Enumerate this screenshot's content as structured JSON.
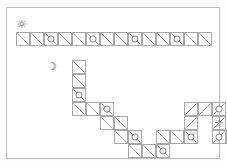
{
  "page": {
    "background_color": "#ffffff",
    "frame_color": "#b9b9b9",
    "cell_border_color": "#a8a8a8",
    "diagonal_color": "#7f7f7f",
    "circle_color": "#6f6f6f"
  },
  "grid": {
    "cell_size": 14,
    "origin_x": 9,
    "origin_y": 24,
    "columns": 15,
    "rows": 9
  },
  "markers": [
    {
      "name": "sun-icon",
      "label": "sun",
      "glyph": "☼",
      "col": 0,
      "row": 0,
      "offset_x": 0,
      "offset_y": -13
    },
    {
      "name": "moon-icon",
      "label": "moon",
      "glyph": "☽",
      "col": 3,
      "row": 2,
      "offset_x": -12,
      "offset_y": 1
    },
    {
      "name": "star-icon",
      "label": "star",
      "glyph": "☆",
      "col": 14,
      "row": 7,
      "offset_x": 1,
      "offset_y": -12
    }
  ],
  "cells": [
    {
      "col": 0,
      "row": 0,
      "diagonal": "down",
      "circle": false
    },
    {
      "col": 1,
      "row": 0,
      "diagonal": "down",
      "circle": false
    },
    {
      "col": 2,
      "row": 0,
      "diagonal": "down",
      "circle": true
    },
    {
      "col": 3,
      "row": 0,
      "diagonal": "down",
      "circle": false
    },
    {
      "col": 4,
      "row": 0,
      "diagonal": "down",
      "circle": false
    },
    {
      "col": 5,
      "row": 0,
      "diagonal": "down",
      "circle": true
    },
    {
      "col": 6,
      "row": 0,
      "diagonal": "down",
      "circle": false
    },
    {
      "col": 7,
      "row": 0,
      "diagonal": "down",
      "circle": false
    },
    {
      "col": 8,
      "row": 0,
      "diagonal": "down",
      "circle": true
    },
    {
      "col": 9,
      "row": 0,
      "diagonal": "down",
      "circle": false
    },
    {
      "col": 10,
      "row": 0,
      "diagonal": "down",
      "circle": false
    },
    {
      "col": 11,
      "row": 0,
      "diagonal": "down",
      "circle": true
    },
    {
      "col": 12,
      "row": 0,
      "diagonal": "down",
      "circle": false
    },
    {
      "col": 13,
      "row": 0,
      "diagonal": "down",
      "circle": false
    },
    {
      "col": 4,
      "row": 2,
      "diagonal": "down",
      "circle": false
    },
    {
      "col": 4,
      "row": 3,
      "diagonal": "down",
      "circle": false
    },
    {
      "col": 4,
      "row": 4,
      "diagonal": "down",
      "circle": true
    },
    {
      "col": 4,
      "row": 5,
      "diagonal": "down",
      "circle": false
    },
    {
      "col": 5,
      "row": 5,
      "diagonal": "down",
      "circle": false
    },
    {
      "col": 6,
      "row": 5,
      "diagonal": "down",
      "circle": true
    },
    {
      "col": 6,
      "row": 6,
      "diagonal": "down",
      "circle": false
    },
    {
      "col": 7,
      "row": 6,
      "diagonal": "down",
      "circle": false
    },
    {
      "col": 7,
      "row": 7,
      "diagonal": "down",
      "circle": false
    },
    {
      "col": 8,
      "row": 7,
      "diagonal": "down",
      "circle": true
    },
    {
      "col": 8,
      "row": 8,
      "diagonal": "down",
      "circle": false
    },
    {
      "col": 9,
      "row": 8,
      "diagonal": "down",
      "circle": false
    },
    {
      "col": 10,
      "row": 8,
      "diagonal": "down",
      "circle": true
    },
    {
      "col": 10,
      "row": 7,
      "diagonal": "down",
      "circle": false
    },
    {
      "col": 11,
      "row": 7,
      "diagonal": "down",
      "circle": false
    },
    {
      "col": 12,
      "row": 7,
      "diagonal": "down",
      "circle": true
    },
    {
      "col": 12,
      "row": 5,
      "diagonal": "up",
      "circle": false
    },
    {
      "col": 12,
      "row": 6,
      "diagonal": "up",
      "circle": false
    },
    {
      "col": 13,
      "row": 5,
      "diagonal": "up",
      "circle": false
    },
    {
      "col": 14,
      "row": 5,
      "diagonal": "up",
      "circle": true
    },
    {
      "col": 14,
      "row": 6,
      "diagonal": "up",
      "circle": false
    },
    {
      "col": 14,
      "row": 7,
      "diagonal": "up",
      "circle": true
    },
    {
      "col": 15,
      "row": 7,
      "diagonal": "down",
      "circle": false
    },
    {
      "col": 16,
      "row": 7,
      "diagonal": "down",
      "circle": false
    },
    {
      "col": 17,
      "row": 7,
      "diagonal": "down",
      "circle": true
    }
  ]
}
